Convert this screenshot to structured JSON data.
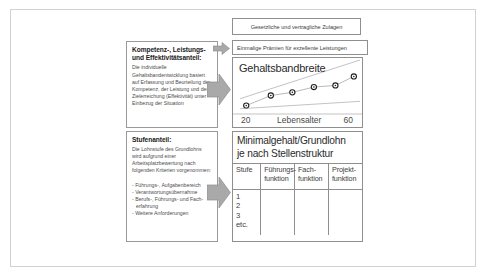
{
  "diagram": {
    "left_boxes": [
      {
        "id": "kompetenz",
        "title": "Kompetenz-, Leistungs- und Effektivitätsanteil:",
        "body": "Die individuelle Gehaltsbandentwicklung basiert auf Erfassung und Beurteilung der Kompetenz, der Leistung und der Zielerreichung (Effektivität) unter Einbezug der Situation"
      },
      {
        "id": "stufen",
        "title": "Stufenanteil:",
        "body": "Die Lohnstufe des Grundlohns wird aufgrund einer Arbeitsplatzbewertung nach folgenden Kriterien vorgenommen:",
        "bullets": [
          "- Führungs-, Aufgabenbereich",
          "- Verantwortungsübernahme",
          "- Berufs-, Führungs- und Fach-",
          "erfahrung",
          "- Weitere Anforderungen"
        ]
      }
    ],
    "strips": [
      {
        "id": "zulagen",
        "label": "Gesetzliche und vertragliche Zulagen"
      },
      {
        "id": "praemien",
        "label": "Einmalige Prämien für exzellente Leistungen"
      }
    ],
    "chart_panel": {
      "title": "Gehaltsbandbreite",
      "axis_left": "20",
      "axis_name": "Lebensalter",
      "axis_right": "60"
    },
    "table_panel": {
      "heading_line1": "Minimalgehalt/Grundlohn",
      "heading_line2": "je nach Stellenstruktur",
      "columns": [
        {
          "line1": "Stufe",
          "line2": ""
        },
        {
          "line1": "Führungs-",
          "line2": "funktion"
        },
        {
          "line1": "Fach-",
          "line2": "funktion"
        },
        {
          "line1": "Projekt-",
          "line2": "funktion"
        }
      ],
      "stufe_values": [
        "1",
        "2",
        "3",
        "etc."
      ]
    },
    "arrows": [
      {
        "id": "arrow-top",
        "direction": "right"
      },
      {
        "id": "arrow-middle",
        "direction": "right"
      },
      {
        "id": "arrow-bottom",
        "direction": "right"
      }
    ],
    "colors": {
      "frame": "#d2d2d2",
      "box_border": "#9a9a9a",
      "panel_border": "#8f8f8f",
      "arrow_fill": "#a6a6a6",
      "text_dark": "#2b2b2b",
      "text_body": "#4e4e4e"
    }
  },
  "chart_data": {
    "type": "scatter",
    "title": "Gehaltsbandbreite",
    "xlabel": "Lebensalter",
    "ylabel": "",
    "xlim": [
      20,
      60
    ],
    "ylim": [
      0,
      100
    ],
    "grid": false,
    "legend": "none",
    "series": [
      {
        "name": "Gehaltsentwicklung",
        "type": "line-markers",
        "x": [
          23,
          31,
          38,
          45,
          52,
          58
        ],
        "y": [
          14,
          33,
          39,
          49,
          52,
          69
        ]
      },
      {
        "name": "Obere Bandgrenze",
        "type": "line",
        "x": [
          21,
          60
        ],
        "y": [
          27,
          100
        ]
      },
      {
        "name": "Untere Bandgrenze",
        "type": "line",
        "x": [
          21,
          60
        ],
        "y": [
          8,
          22
        ]
      }
    ]
  }
}
